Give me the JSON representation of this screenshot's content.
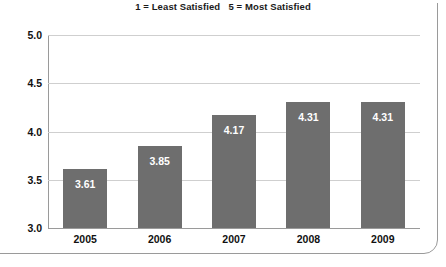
{
  "chart_data": {
    "type": "bar",
    "title": "1 = Least Satisfied   5 = Most Satisfied",
    "xlabel": "",
    "ylabel": "",
    "categories": [
      "2005",
      "2006",
      "2007",
      "2008",
      "2009"
    ],
    "values": [
      3.61,
      3.85,
      4.17,
      4.31,
      4.31
    ],
    "value_labels": [
      "3.61",
      "3.85",
      "4.17",
      "4.31",
      "4.31"
    ],
    "ylim": [
      3.0,
      5.0
    ],
    "yticks": [
      3.0,
      3.5,
      4.0,
      4.5,
      5.0
    ],
    "ytick_labels": [
      "3.0",
      "3.5",
      "4.0",
      "4.5",
      "5.0"
    ],
    "grid": true,
    "legend": null,
    "series": [
      {
        "name": "Satisfaction",
        "values": [
          3.61,
          3.85,
          4.17,
          4.31,
          4.31
        ]
      }
    ],
    "colors": {
      "bar": "#6e6e6e",
      "gridline": "#cfcfcf",
      "axis": "#9a9a9a",
      "label_text": "#ffffff",
      "tick_text": "#111111",
      "background": "#ffffff",
      "frame_border": "#9a9a9a"
    }
  }
}
